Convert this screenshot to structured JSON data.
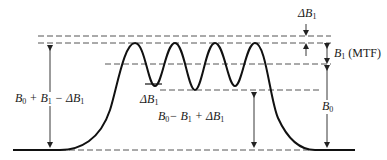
{
  "diagram": {
    "colors": {
      "curve": "#111111",
      "dashed": "#555555",
      "arrow": "#222222",
      "background": "#ffffff"
    },
    "labels": {
      "delta_b1_top": {
        "symbol": "ΔB",
        "sub": "1"
      },
      "b1_mtf": {
        "symbol": "B",
        "sub": "1",
        "suffix": "(MTF)"
      },
      "b0_right": {
        "symbol": "B",
        "sub": "0"
      },
      "left_span": {
        "parts": [
          "B",
          "0",
          " + B",
          "1",
          " − ΔB",
          "1"
        ]
      },
      "delta_b1_trough": {
        "symbol": "ΔB",
        "sub": "1"
      },
      "center_span": {
        "parts": [
          "B",
          "0",
          "− B",
          "1",
          " + ΔB",
          "1"
        ]
      }
    },
    "levels": {
      "top_dashed_y": 36,
      "peak_dashed_y": 43,
      "mid_dashed_y": 64,
      "trough_dashed_y": 90,
      "baseline_y": 150
    },
    "ripple": {
      "peaks_x": [
        135,
        175,
        215,
        255
      ],
      "troughs_x": [
        155,
        195,
        235
      ]
    }
  }
}
